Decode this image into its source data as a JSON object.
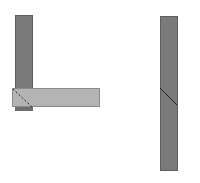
{
  "diagram": {
    "left_assembly": {
      "vertical_bar": {
        "x": 15,
        "y": 15,
        "w": 18,
        "h": 96,
        "color": "#7a7a7a",
        "border": "#5e5e5e"
      },
      "horizontal_bar": {
        "x": 12,
        "y": 88,
        "w": 88,
        "h": 19,
        "color": "#b4b4b4",
        "border": "#8a8a8a"
      },
      "bottom_block": {
        "x": 15,
        "y": 106,
        "w": 18,
        "h": 5,
        "color": "#6e6e6e"
      },
      "miter_line": {
        "x1": 13,
        "y1": 89,
        "x2": 32,
        "y2": 107,
        "style": "dashed",
        "color": "#222222"
      }
    },
    "right_assembly": {
      "vertical_bar": {
        "x": 160,
        "y": 16,
        "w": 18,
        "h": 155,
        "color": "#7a7a7a",
        "border": "#5e5e5e"
      },
      "miter_line": {
        "x1": 160,
        "y1": 88,
        "x2": 177,
        "y2": 105,
        "style": "solid",
        "color": "#222222"
      }
    }
  }
}
